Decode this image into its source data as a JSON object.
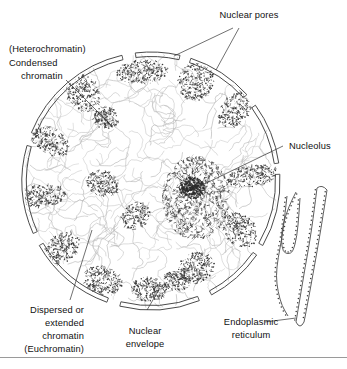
{
  "figure": {
    "background_color": "#ffffff",
    "line_color": "#4a4a4a",
    "text_color": "#111111",
    "rule_color": "#9a9a9a"
  },
  "labels": {
    "nuclear_pores": "Nuclear pores",
    "heterochromatin_paren": "(Heterochromatin)",
    "condensed_line1": "Condensed",
    "condensed_line2": "chromatin",
    "nucleolus": "Nucleolus",
    "euchromatin_line1": "Dispersed or",
    "euchromatin_line2": "extended",
    "euchromatin_line3": "chromatin",
    "euchromatin_line4": "(Euchromatin)",
    "nuclear_envelope_line1": "Nuclear",
    "nuclear_envelope_line2": "envelope",
    "endoplasmic_line1": "Endoplasmic",
    "endoplasmic_line2": "reticulum"
  },
  "nucleus": {
    "center_x": 151,
    "center_y": 181,
    "radius": 129,
    "envelope_gap_count": 8
  },
  "envelope_arcs": [
    {
      "start_deg": 263,
      "end_deg": 283
    },
    {
      "start_deg": 288,
      "end_deg": 318
    },
    {
      "start_deg": 324,
      "end_deg": 352
    },
    {
      "start_deg": 357,
      "end_deg": 30
    },
    {
      "start_deg": 35,
      "end_deg": 62
    },
    {
      "start_deg": 68,
      "end_deg": 104
    },
    {
      "start_deg": 110,
      "end_deg": 150
    },
    {
      "start_deg": 156,
      "end_deg": 196
    },
    {
      "start_deg": 202,
      "end_deg": 257
    }
  ],
  "heterochromatin_patches": [
    {
      "cx": 143,
      "cy": 72,
      "rx": 26,
      "ry": 12,
      "rot": -3,
      "density": 230
    },
    {
      "cx": 196,
      "cy": 82,
      "rx": 18,
      "ry": 19,
      "rot": 25,
      "density": 230
    },
    {
      "cx": 237,
      "cy": 108,
      "rx": 14,
      "ry": 23,
      "rot": 42,
      "density": 220
    },
    {
      "cx": 252,
      "cy": 176,
      "rx": 11,
      "ry": 26,
      "rot": 80,
      "density": 200
    },
    {
      "cx": 240,
      "cy": 230,
      "rx": 15,
      "ry": 20,
      "rot": 128,
      "density": 200
    },
    {
      "cx": 196,
      "cy": 268,
      "rx": 19,
      "ry": 15,
      "rot": 158,
      "density": 210
    },
    {
      "cx": 149,
      "cy": 289,
      "rx": 18,
      "ry": 12,
      "rot": 180,
      "density": 200
    },
    {
      "cx": 103,
      "cy": 281,
      "rx": 20,
      "ry": 14,
      "rot": 200,
      "density": 210
    },
    {
      "cx": 62,
      "cy": 248,
      "rx": 14,
      "ry": 20,
      "rot": 230,
      "density": 200
    },
    {
      "cx": 42,
      "cy": 196,
      "rx": 11,
      "ry": 24,
      "rot": 265,
      "density": 200
    },
    {
      "cx": 48,
      "cy": 140,
      "rx": 13,
      "ry": 24,
      "rot": 300,
      "density": 210
    },
    {
      "cx": 83,
      "cy": 93,
      "rx": 16,
      "ry": 20,
      "rot": 330,
      "density": 210
    },
    {
      "cx": 106,
      "cy": 118,
      "rx": 13,
      "ry": 11,
      "rot": 10,
      "density": 150
    },
    {
      "cx": 103,
      "cy": 183,
      "rx": 17,
      "ry": 13,
      "rot": 20,
      "density": 170
    },
    {
      "cx": 136,
      "cy": 216,
      "rx": 13,
      "ry": 15,
      "rot": 50,
      "density": 150
    },
    {
      "cx": 177,
      "cy": 280,
      "rx": 14,
      "ry": 11,
      "rot": 0,
      "density": 140
    }
  ],
  "nucleolus": {
    "cx": 196,
    "cy": 198,
    "rx": 34,
    "ry": 42,
    "core_cx": 192,
    "core_cy": 188,
    "core_r": 11,
    "stipple_density": 700
  },
  "euchromatin": {
    "strand_count": 190,
    "stroke_color": "#b8b8b8"
  },
  "endoplasmic_reticulum": {
    "cisterna_count": 2,
    "ribosome_dots": true
  },
  "leader_lines": {
    "nuclear_pores": [
      {
        "from_x": 233,
        "from_y": 28,
        "to_x": 174,
        "to_y": 56
      },
      {
        "from_x": 239,
        "from_y": 28,
        "to_x": 216,
        "to_y": 70
      }
    ],
    "condensed_chromatin": {
      "from_x": 66,
      "from_y": 80,
      "to_x": 110,
      "to_y": 124
    },
    "nucleolus": {
      "from_x": 283,
      "from_y": 146,
      "to_x": 192,
      "to_y": 190
    },
    "euchromatin": {
      "from_x": 70,
      "from_y": 300,
      "to_x": 92,
      "to_y": 230
    },
    "nuclear_envelope": {
      "from_x": 147,
      "from_y": 310,
      "to_x": 160,
      "to_y": 288
    },
    "endoplasmic_reticulum": {
      "from_x": 265,
      "from_y": 322,
      "to_x": 296,
      "to_y": 318
    }
  }
}
